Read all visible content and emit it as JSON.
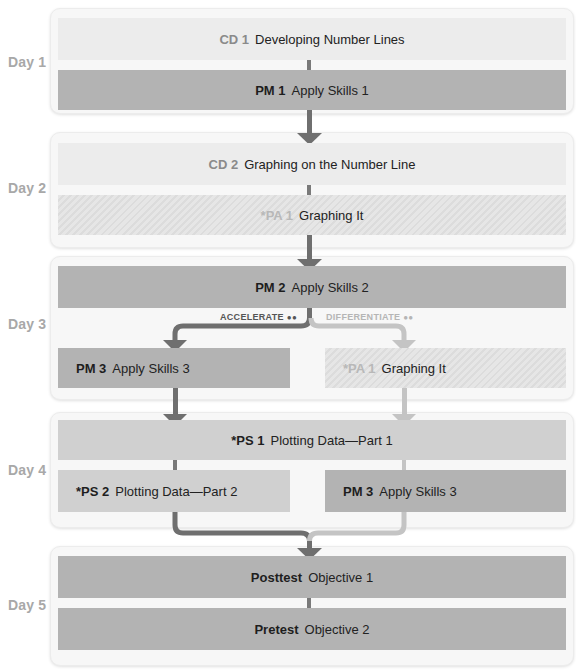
{
  "colors": {
    "dark_arrow": "#6f6f6f",
    "light_arrow": "#bdbdbd",
    "dark_box": "#b3b3b3",
    "light_box": "#ececec",
    "day_label": "#a8a8a8"
  },
  "days": [
    {
      "label": "Day 1",
      "items": [
        {
          "code": "CD 1",
          "title": "Developing Number Lines",
          "style": "light"
        },
        {
          "code": "PM 1",
          "title": "Apply Skills 1",
          "style": "dark"
        }
      ]
    },
    {
      "label": "Day 2",
      "items": [
        {
          "code": "CD 2",
          "title": "Graphing on the Number Line",
          "style": "light"
        },
        {
          "code": "*PA 1",
          "title": "Graphing It",
          "style": "hatch"
        }
      ]
    },
    {
      "label": "Day 3",
      "items": [
        {
          "code": "PM 2",
          "title": "Apply Skills 2",
          "style": "dark"
        },
        {
          "code": "PM 3",
          "title": "Apply Skills 3",
          "style": "dark"
        },
        {
          "code": "*PA 1",
          "title": "Graphing It",
          "style": "hatch"
        }
      ],
      "branches": {
        "accelerate": {
          "label": "ACCELERATE",
          "icon": "group-icon"
        },
        "differentiate": {
          "label": "DIFFERENTIATE",
          "icon": "group-icon"
        }
      }
    },
    {
      "label": "Day 4",
      "items": [
        {
          "code": "*PS 1",
          "title": "Plotting Data—Part 1",
          "style": "mid"
        },
        {
          "code": "*PS 2",
          "title": "Plotting Data—Part 2",
          "style": "mid"
        },
        {
          "code": "PM 3",
          "title": "Apply Skills 3",
          "style": "dark"
        }
      ]
    },
    {
      "label": "Day 5",
      "items": [
        {
          "code": "Posttest",
          "title": "Objective 1",
          "style": "dark"
        },
        {
          "code": "Pretest",
          "title": "Objective 2",
          "style": "dark"
        }
      ]
    }
  ]
}
